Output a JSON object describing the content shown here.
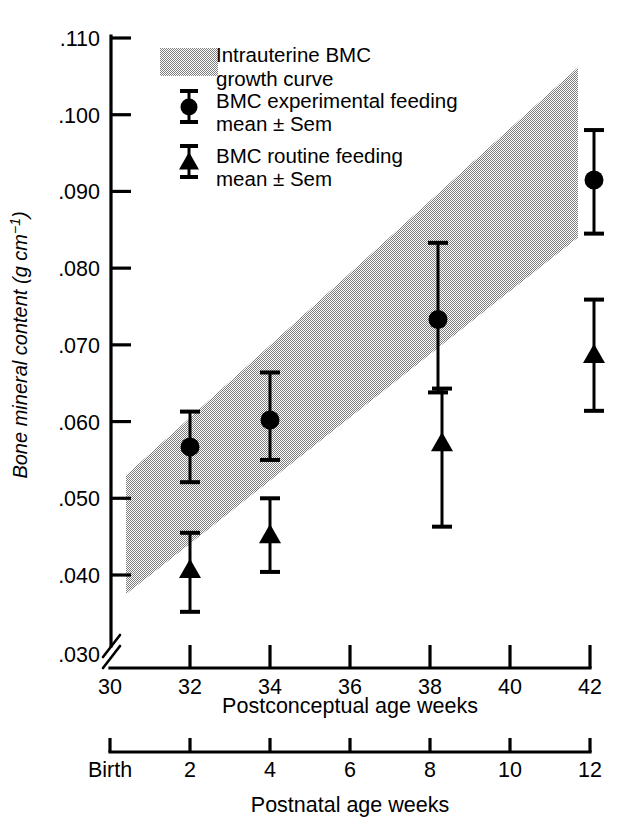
{
  "chart_data": {
    "type": "scatter",
    "title": "",
    "xlabel": "Postconceptual age weeks",
    "ylabel": "Bone mineral content (g cm⁻¹)",
    "xlim": [
      30,
      42
    ],
    "ylim": [
      0.03,
      0.11
    ],
    "grid": false,
    "axis_break_y": true,
    "y_ticks": [
      ".030",
      ".040",
      ".050",
      ".060",
      ".070",
      ".080",
      ".090",
      ".100",
      ".110"
    ],
    "y_tick_values": [
      0.03,
      0.04,
      0.05,
      0.06,
      0.07,
      0.08,
      0.09,
      0.1,
      0.11
    ],
    "x_ticks": [
      "30",
      "32",
      "34",
      "36",
      "38",
      "40",
      "42"
    ],
    "x_tick_values": [
      30,
      32,
      34,
      36,
      38,
      40,
      42
    ],
    "secondary_xlabel": "Postnatal age weeks",
    "secondary_x_ticks": [
      "Birth",
      "2",
      "4",
      "6",
      "8",
      "10",
      "12"
    ],
    "secondary_x_tick_values": [
      0,
      2,
      4,
      6,
      8,
      10,
      12
    ],
    "legend_position": "top-center",
    "series": [
      {
        "name": "Intrauterine BMC growth curve",
        "type": "band",
        "color": "#8c8c8c",
        "x": [
          30.4,
          41.7
        ],
        "upper": [
          0.053,
          0.1062
        ],
        "lower": [
          0.0375,
          0.084
        ]
      },
      {
        "name": "BMC experimental feeding mean ± Sem",
        "type": "scatter",
        "marker": "circle",
        "color": "#000000",
        "x": [
          32,
          34,
          38.2,
          42.1
        ],
        "y": [
          0.0567,
          0.0602,
          0.0733,
          0.0915
        ],
        "yerr_upper": [
          0.0613,
          0.0664,
          0.0833,
          0.098
        ],
        "yerr_lower": [
          0.0521,
          0.055,
          0.0638,
          0.0845
        ]
      },
      {
        "name": "BMC routine feeding mean ± Sem",
        "type": "scatter",
        "marker": "triangle",
        "color": "#000000",
        "x": [
          32,
          34,
          38.3,
          42.1
        ],
        "y": [
          0.0407,
          0.0452,
          0.0572,
          0.0687
        ],
        "yerr_upper": [
          0.0455,
          0.05,
          0.0643,
          0.0759
        ],
        "yerr_lower": [
          0.0352,
          0.0404,
          0.0463,
          0.0614
        ]
      }
    ]
  },
  "axes": {
    "y_title": "Bone mineral content (g cm",
    "y_title_sup": "−1",
    "y_title_close": ")",
    "x_title": "Postconceptual age weeks",
    "x2_title": "Postnatal age weeks"
  },
  "y_tick_labels": [
    {
      "text": ".110",
      "value": 0.11
    },
    {
      "text": ".100",
      "value": 0.1
    },
    {
      "text": ".090",
      "value": 0.09
    },
    {
      "text": ".080",
      "value": 0.08
    },
    {
      "text": ".070",
      "value": 0.07
    },
    {
      "text": ".060",
      "value": 0.06
    },
    {
      "text": ".050",
      "value": 0.05
    },
    {
      "text": ".040",
      "value": 0.04
    },
    {
      "text": ".030",
      "value": 0.03
    }
  ],
  "x_tick_labels": [
    {
      "text": "30",
      "value": 30
    },
    {
      "text": "32",
      "value": 32
    },
    {
      "text": "34",
      "value": 34
    },
    {
      "text": "36",
      "value": 36
    },
    {
      "text": "38",
      "value": 38
    },
    {
      "text": "40",
      "value": 40
    },
    {
      "text": "42",
      "value": 42
    }
  ],
  "x2_tick_labels": [
    {
      "text": "Birth",
      "value": 0
    },
    {
      "text": "2",
      "value": 2
    },
    {
      "text": "4",
      "value": 4
    },
    {
      "text": "6",
      "value": 6
    },
    {
      "text": "8",
      "value": 8
    },
    {
      "text": "10",
      "value": 10
    },
    {
      "text": "12",
      "value": 12
    }
  ],
  "legend": {
    "items": [
      {
        "marker": "band-swatch",
        "line1": "Intrauterine BMC",
        "line2": "growth curve"
      },
      {
        "marker": "circle-errorbar",
        "line1": "BMC experimental feeding",
        "line2": "mean ± Sem"
      },
      {
        "marker": "triangle-errorbar",
        "line1": "BMC routine feeding",
        "line2": "mean ±  Sem"
      }
    ]
  },
  "colors": {
    "band": "#8c8c8c",
    "marker": "#000000",
    "axis": "#000000",
    "background": "#ffffff"
  }
}
